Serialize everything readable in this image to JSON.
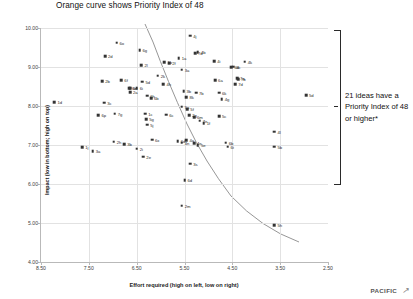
{
  "chart_data": {
    "type": "scatter",
    "title": "Orange curve shows Priority Index of 48",
    "xlabel": "Effort required (high on left, low on right)",
    "ylabel": "Impact (low in bottom; high on top)",
    "xlim": [
      8.5,
      2.5
    ],
    "ylim": [
      4.0,
      10.0
    ],
    "x_ticks": [
      "8.50",
      "7.50",
      "6.50",
      "5.50",
      "4.50",
      "3.50",
      "2.50"
    ],
    "y_ticks": [
      "10.00",
      "9.00",
      "8.00",
      "7.00",
      "6.00",
      "5.00",
      "4.00"
    ],
    "x_axis_inverted": true,
    "grid": true,
    "legend": "none",
    "curve_label": "Priority Index of 48 iso-curve",
    "curve_color": "#888888",
    "point_color": "#333333",
    "points": [
      {
        "label": "6o",
        "x": 6.92,
        "y": 9.62
      },
      {
        "label": "4j",
        "x": 5.38,
        "y": 9.8
      },
      {
        "label": "6g",
        "x": 6.44,
        "y": 9.43
      },
      {
        "label": "4b",
        "x": 5.22,
        "y": 9.38
      },
      {
        "label": "7d",
        "x": 5.28,
        "y": 9.35
      },
      {
        "label": "2d",
        "x": 7.16,
        "y": 9.28
      },
      {
        "label": "1a",
        "x": 5.62,
        "y": 9.22
      },
      {
        "label": "4i",
        "x": 4.88,
        "y": 9.15
      },
      {
        "label": "4k",
        "x": 4.24,
        "y": 9.14
      },
      {
        "label": "1b",
        "x": 5.92,
        "y": 9.12
      },
      {
        "label": "2f",
        "x": 5.82,
        "y": 9.1
      },
      {
        "label": "2l",
        "x": 6.4,
        "y": 9.04
      },
      {
        "label": "4c",
        "x": 4.48,
        "y": 9.01
      },
      {
        "label": "4d",
        "x": 4.52,
        "y": 8.99
      },
      {
        "label": "3a",
        "x": 5.56,
        "y": 8.93
      },
      {
        "label": "2k",
        "x": 6.06,
        "y": 8.78
      },
      {
        "label": "7a",
        "x": 4.4,
        "y": 8.72
      },
      {
        "label": "7b",
        "x": 4.38,
        "y": 8.68
      },
      {
        "label": "6a",
        "x": 4.86,
        "y": 8.66
      },
      {
        "label": "2b",
        "x": 7.22,
        "y": 8.64
      },
      {
        "label": "6f",
        "x": 6.82,
        "y": 8.66
      },
      {
        "label": "5d",
        "x": 6.38,
        "y": 8.62
      },
      {
        "label": "7d2",
        "x": 4.44,
        "y": 8.56
      },
      {
        "label": "4h",
        "x": 5.94,
        "y": 8.56
      },
      {
        "label": "6e",
        "x": 6.66,
        "y": 8.46
      },
      {
        "label": "6n",
        "x": 6.64,
        "y": 8.45
      },
      {
        "label": "6i",
        "x": 6.5,
        "y": 8.45
      },
      {
        "label": "2a",
        "x": 6.64,
        "y": 8.36
      },
      {
        "label": "3b",
        "x": 5.52,
        "y": 8.38
      },
      {
        "label": "7b2",
        "x": 5.26,
        "y": 8.34
      },
      {
        "label": "6k",
        "x": 4.78,
        "y": 8.34
      },
      {
        "label": "6h",
        "x": 6.28,
        "y": 8.26
      },
      {
        "label": "5d2",
        "x": 2.96,
        "y": 8.28
      },
      {
        "label": "8k",
        "x": 5.46,
        "y": 8.22
      },
      {
        "label": "6b",
        "x": 6.2,
        "y": 8.2
      },
      {
        "label": "4g",
        "x": 4.72,
        "y": 8.18
      },
      {
        "label": "1d",
        "x": 8.22,
        "y": 8.1
      },
      {
        "label": "3c",
        "x": 7.18,
        "y": 8.08
      },
      {
        "label": "5a",
        "x": 5.56,
        "y": 7.98
      },
      {
        "label": "5f",
        "x": 5.44,
        "y": 7.92
      },
      {
        "label": "6p",
        "x": 7.3,
        "y": 7.76
      },
      {
        "label": "7g",
        "x": 6.96,
        "y": 7.8
      },
      {
        "label": "1c",
        "x": 6.32,
        "y": 7.8
      },
      {
        "label": "6c",
        "x": 5.88,
        "y": 7.78
      },
      {
        "label": "2g",
        "x": 5.4,
        "y": 7.76
      },
      {
        "label": "6m",
        "x": 5.3,
        "y": 7.72
      },
      {
        "label": "5c",
        "x": 4.78,
        "y": 7.74
      },
      {
        "label": "5g",
        "x": 6.3,
        "y": 7.66
      },
      {
        "label": "7e",
        "x": 5.18,
        "y": 7.62
      },
      {
        "label": "1f",
        "x": 5.1,
        "y": 7.56
      },
      {
        "label": "5j",
        "x": 6.28,
        "y": 7.52
      },
      {
        "label": "4l",
        "x": 3.62,
        "y": 7.34
      },
      {
        "label": "6x",
        "x": 6.18,
        "y": 7.14
      },
      {
        "label": "4a",
        "x": 5.46,
        "y": 7.12
      },
      {
        "label": "6d",
        "x": 5.64,
        "y": 7.1
      },
      {
        "label": "2h",
        "x": 6.98,
        "y": 7.08
      },
      {
        "label": "4n",
        "x": 5.56,
        "y": 7.06
      },
      {
        "label": "4e",
        "x": 5.3,
        "y": 7.04
      },
      {
        "label": "6b2",
        "x": 4.64,
        "y": 7.06
      },
      {
        "label": "3b2",
        "x": 6.76,
        "y": 7.02
      },
      {
        "label": "5e",
        "x": 5.22,
        "y": 7.0
      },
      {
        "label": "6t",
        "x": 4.6,
        "y": 6.96
      },
      {
        "label": "5b",
        "x": 3.62,
        "y": 6.96
      },
      {
        "label": "1j",
        "x": 7.64,
        "y": 6.94
      },
      {
        "label": "2i",
        "x": 6.5,
        "y": 6.9
      },
      {
        "label": "3a2",
        "x": 7.42,
        "y": 6.84
      },
      {
        "label": "2e",
        "x": 6.36,
        "y": 6.7
      },
      {
        "label": "3s",
        "x": 5.38,
        "y": 6.52
      },
      {
        "label": "6d2",
        "x": 5.5,
        "y": 6.1
      },
      {
        "label": "2m",
        "x": 5.56,
        "y": 5.44
      },
      {
        "label": "5h",
        "x": 3.62,
        "y": 4.94
      }
    ]
  },
  "annotation": {
    "text": "21 ideas have a Priority Index of 48 or higher*"
  },
  "brand": {
    "word": "PACIFIC",
    "mark": "↗"
  }
}
